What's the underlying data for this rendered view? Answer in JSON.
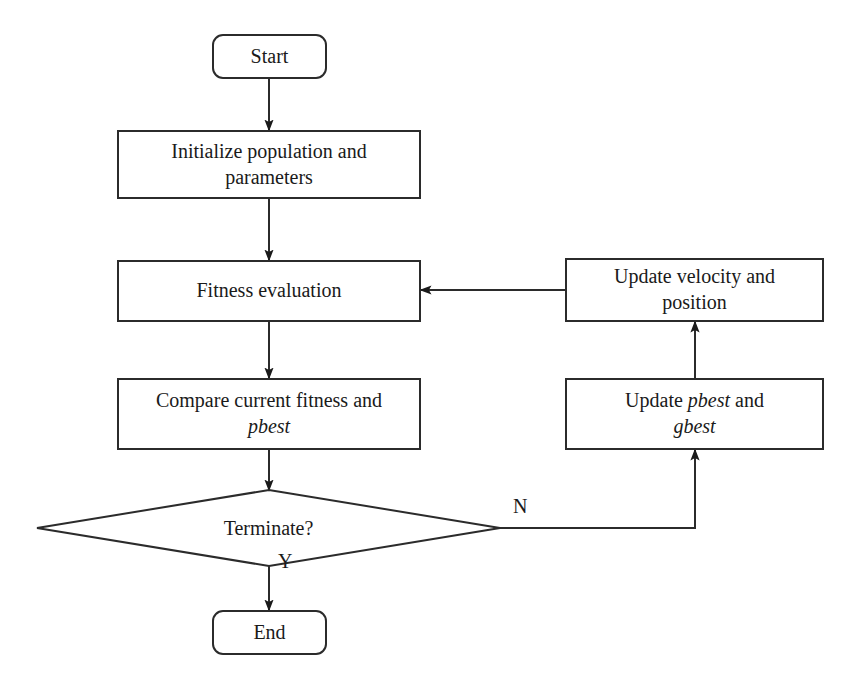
{
  "diagram": {
    "type": "flowchart",
    "stroke_color": "#2b2b2b",
    "background_color": "#ffffff",
    "text_color": "#1a1a1a"
  },
  "nodes": {
    "start": {
      "label": "Start",
      "shape": "terminal"
    },
    "initialize": {
      "line1": "Initialize population and",
      "line2": "parameters",
      "shape": "process"
    },
    "fitness": {
      "label": "Fitness evaluation",
      "shape": "process"
    },
    "compare": {
      "line1": "Compare current fitness and",
      "line2": "pbest",
      "line2_italic": true,
      "shape": "process"
    },
    "terminate": {
      "label": "Terminate?",
      "shape": "decision"
    },
    "end": {
      "label": "End",
      "shape": "terminal"
    },
    "update_velocity": {
      "line1": "Update velocity and",
      "line2": "position",
      "shape": "process"
    },
    "update_best": {
      "line1_prefix": "Update ",
      "line1_italic": "pbest",
      "line1_suffix": " and",
      "line2_italic": "gbest",
      "shape": "process"
    }
  },
  "edge_labels": {
    "no_branch": "N",
    "yes_branch": "Y"
  }
}
